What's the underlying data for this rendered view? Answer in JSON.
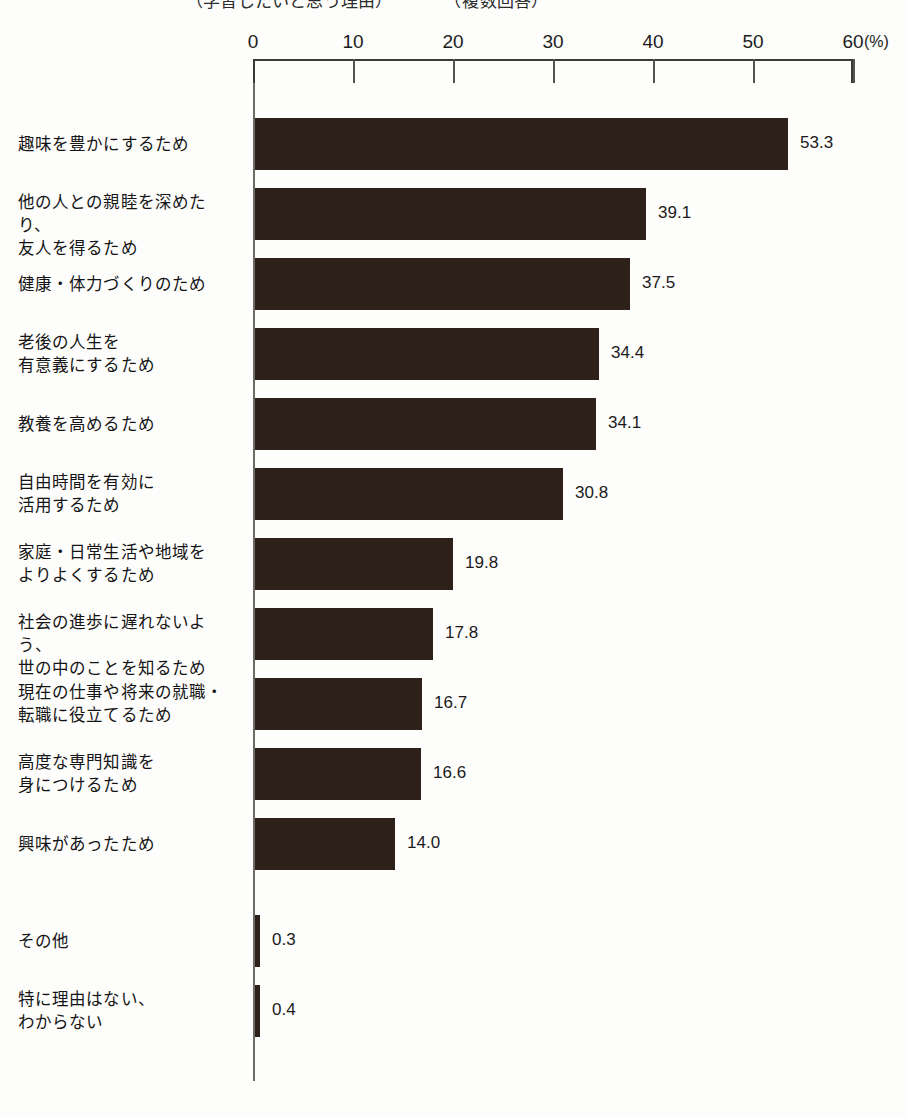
{
  "title": {
    "text": "（学習したいと思う理由）　　　　（複数回答）",
    "visible_partially": true
  },
  "axis": {
    "unit": "(%)",
    "ticks": [
      {
        "label": "0",
        "value": 0
      },
      {
        "label": "10",
        "value": 10
      },
      {
        "label": "20",
        "value": 20
      },
      {
        "label": "30",
        "value": 30
      },
      {
        "label": "40",
        "value": 40
      },
      {
        "label": "50",
        "value": 50
      },
      {
        "label": "60",
        "value": 60
      }
    ]
  },
  "colors": {
    "bar": "#2e2119",
    "background": "#fdfdfb",
    "axis": "#3a3a36",
    "text": "#141414"
  },
  "chart_data": {
    "type": "bar",
    "orientation": "horizontal",
    "title": "（学習したいと思う理由）　　　　（複数回答）",
    "xlabel": "(%)",
    "ylabel": "",
    "xlim": [
      0,
      60
    ],
    "grid": false,
    "legend": false,
    "categories": [
      "趣味を豊かにするため",
      "他の人との親睦を深めたり、\n友人を得るため",
      "健康・体力づくりのため",
      "老後の人生を\n有意義にするため",
      "教養を高めるため",
      "自由時間を有効に\n活用するため",
      "家庭・日常生活や地域を\nよりよくするため",
      "社会の進歩に遅れないよう、\n世の中のことを知るため",
      "現在の仕事や将来の就職・\n転職に役立てるため",
      "高度な専門知識を\n身につけるため",
      "興味があったため",
      "その他",
      "特に理由はない、\nわからない"
    ],
    "values": [
      53.3,
      39.1,
      37.5,
      34.4,
      34.1,
      30.8,
      19.8,
      17.8,
      16.7,
      16.6,
      14.0,
      0.3,
      0.4
    ],
    "value_labels": [
      "53.3",
      "39.1",
      "37.5",
      "34.4",
      "34.1",
      "30.8",
      "19.8",
      "17.8",
      "16.7",
      "16.6",
      "14.0",
      "0.3",
      "0.4"
    ]
  }
}
